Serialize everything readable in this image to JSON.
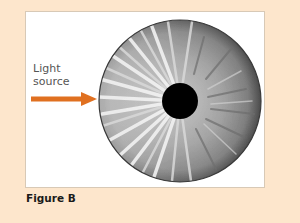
{
  "figure": {
    "caption": "Figure B",
    "label_line1": "Light",
    "label_line2": "source",
    "colors": {
      "background": "#fde6cc",
      "panel": "#ffffff",
      "arrow": "#e07020",
      "pupil": "#000000"
    },
    "elements": {
      "arrow": "arrow-right-icon",
      "iris": "iris-illustration",
      "pupil": "pupil"
    }
  }
}
